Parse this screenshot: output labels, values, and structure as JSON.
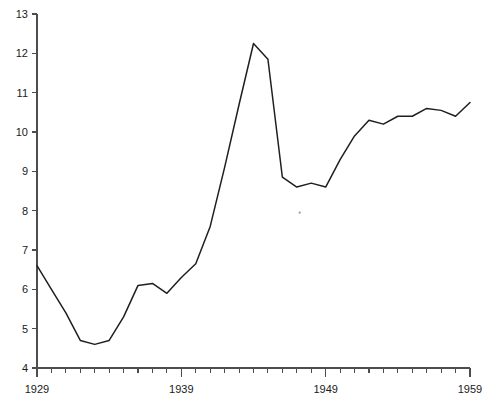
{
  "chart_data": {
    "type": "line",
    "title": "",
    "subtitle": "",
    "xlabel": "",
    "ylabel": "",
    "xlim": [
      1929,
      1959
    ],
    "ylim": [
      4,
      13
    ],
    "grid": false,
    "legend": "none",
    "x_tick_labels": [
      "1929",
      "1939",
      "1949",
      "1959"
    ],
    "x_tick_label_values": [
      1929,
      1939,
      1949,
      1959
    ],
    "x_minor_tick_interval": 1,
    "y_tick_labels": [
      "4",
      "5",
      "6",
      "7",
      "8",
      "9",
      "10",
      "11",
      "12",
      "13"
    ],
    "y_tick_values": [
      4,
      5,
      6,
      7,
      8,
      9,
      10,
      11,
      12,
      13
    ],
    "series": [
      {
        "name": "series-1",
        "color": "#1f1f1f",
        "x": [
          1929,
          1930,
          1931,
          1932,
          1933,
          1934,
          1935,
          1936,
          1937,
          1938,
          1939,
          1940,
          1941,
          1942,
          1943,
          1944,
          1945,
          1946,
          1947,
          1948,
          1949,
          1950,
          1951,
          1952,
          1953,
          1954,
          1955,
          1956,
          1957,
          1958,
          1959
        ],
        "values": [
          6.6,
          6.0,
          5.4,
          4.7,
          4.6,
          4.7,
          5.3,
          6.1,
          6.15,
          5.9,
          6.3,
          6.65,
          7.6,
          9.1,
          10.7,
          12.25,
          11.85,
          8.85,
          8.6,
          8.7,
          8.6,
          9.3,
          9.9,
          10.3,
          10.2,
          10.4,
          10.4,
          10.6,
          10.55,
          10.4,
          10.75
        ],
        "marker": "none",
        "linewidth": 1.5
      }
    ],
    "annotations": [
      {
        "name": "stray-dot-artifact",
        "x": 1947.2,
        "y": 7.95,
        "shape": "dot",
        "color": "#9a9a9a"
      }
    ]
  },
  "axes": {
    "y_axis_name": "y-axis",
    "x_axis_name": "x-axis",
    "tick_color": "#4d4d4d"
  }
}
